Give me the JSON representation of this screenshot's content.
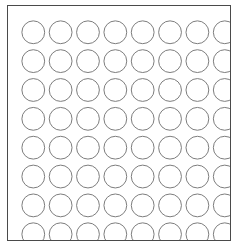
{
  "figure": {
    "name": "circle-grid-diagram",
    "type": "grid-of-circles",
    "background_color": "#ffffff"
  },
  "frame": {
    "name": "grid-frame",
    "border_color": "#4a4a4a",
    "border_width_px": 1,
    "fill_color": "#ffffff",
    "x": 7,
    "y": 5,
    "width": 224,
    "height": 236
  },
  "grid": {
    "rows": 8,
    "columns": 8,
    "total_circles": 64,
    "circle_radius_px": 11.5,
    "column_pitch_px": 27.6,
    "row_pitch_px": 29.1,
    "first_center_x": 21,
    "first_center_y": 20,
    "circle_stroke_color": "#7b7b7b",
    "circle_stroke_width_px": 1,
    "circle_fill": "none"
  },
  "circles": [
    {
      "row": 1,
      "col": 1,
      "cx": 21.0,
      "cy": 20.0
    },
    {
      "row": 1,
      "col": 2,
      "cx": 48.6,
      "cy": 20.0
    },
    {
      "row": 1,
      "col": 3,
      "cx": 76.2,
      "cy": 20.0
    },
    {
      "row": 1,
      "col": 4,
      "cx": 103.8,
      "cy": 20.0
    },
    {
      "row": 1,
      "col": 5,
      "cx": 131.4,
      "cy": 20.0
    },
    {
      "row": 1,
      "col": 6,
      "cx": 159.0,
      "cy": 20.0
    },
    {
      "row": 1,
      "col": 7,
      "cx": 186.6,
      "cy": 20.0
    },
    {
      "row": 1,
      "col": 8,
      "cx": 214.2,
      "cy": 20.0
    },
    {
      "row": 2,
      "col": 1,
      "cx": 21.0,
      "cy": 49.1
    },
    {
      "row": 2,
      "col": 2,
      "cx": 48.6,
      "cy": 49.1
    },
    {
      "row": 2,
      "col": 3,
      "cx": 76.2,
      "cy": 49.1
    },
    {
      "row": 2,
      "col": 4,
      "cx": 103.8,
      "cy": 49.1
    },
    {
      "row": 2,
      "col": 5,
      "cx": 131.4,
      "cy": 49.1
    },
    {
      "row": 2,
      "col": 6,
      "cx": 159.0,
      "cy": 49.1
    },
    {
      "row": 2,
      "col": 7,
      "cx": 186.6,
      "cy": 49.1
    },
    {
      "row": 2,
      "col": 8,
      "cx": 214.2,
      "cy": 49.1
    },
    {
      "row": 3,
      "col": 1,
      "cx": 21.0,
      "cy": 78.2
    },
    {
      "row": 3,
      "col": 2,
      "cx": 48.6,
      "cy": 78.2
    },
    {
      "row": 3,
      "col": 3,
      "cx": 76.2,
      "cy": 78.2
    },
    {
      "row": 3,
      "col": 4,
      "cx": 103.8,
      "cy": 78.2
    },
    {
      "row": 3,
      "col": 5,
      "cx": 131.4,
      "cy": 78.2
    },
    {
      "row": 3,
      "col": 6,
      "cx": 159.0,
      "cy": 78.2
    },
    {
      "row": 3,
      "col": 7,
      "cx": 186.6,
      "cy": 78.2
    },
    {
      "row": 3,
      "col": 8,
      "cx": 214.2,
      "cy": 78.2
    },
    {
      "row": 4,
      "col": 1,
      "cx": 21.0,
      "cy": 107.3
    },
    {
      "row": 4,
      "col": 2,
      "cx": 48.6,
      "cy": 107.3
    },
    {
      "row": 4,
      "col": 3,
      "cx": 76.2,
      "cy": 107.3
    },
    {
      "row": 4,
      "col": 4,
      "cx": 103.8,
      "cy": 107.3
    },
    {
      "row": 4,
      "col": 5,
      "cx": 131.4,
      "cy": 107.3
    },
    {
      "row": 4,
      "col": 6,
      "cx": 159.0,
      "cy": 107.3
    },
    {
      "row": 4,
      "col": 7,
      "cx": 186.6,
      "cy": 107.3
    },
    {
      "row": 4,
      "col": 8,
      "cx": 214.2,
      "cy": 107.3
    },
    {
      "row": 5,
      "col": 1,
      "cx": 21.0,
      "cy": 136.4
    },
    {
      "row": 5,
      "col": 2,
      "cx": 48.6,
      "cy": 136.4
    },
    {
      "row": 5,
      "col": 3,
      "cx": 76.2,
      "cy": 136.4
    },
    {
      "row": 5,
      "col": 4,
      "cx": 103.8,
      "cy": 136.4
    },
    {
      "row": 5,
      "col": 5,
      "cx": 131.4,
      "cy": 136.4
    },
    {
      "row": 5,
      "col": 6,
      "cx": 159.0,
      "cy": 136.4
    },
    {
      "row": 5,
      "col": 7,
      "cx": 186.6,
      "cy": 136.4
    },
    {
      "row": 5,
      "col": 8,
      "cx": 214.2,
      "cy": 136.4
    },
    {
      "row": 6,
      "col": 1,
      "cx": 21.0,
      "cy": 165.5
    },
    {
      "row": 6,
      "col": 2,
      "cx": 48.6,
      "cy": 165.5
    },
    {
      "row": 6,
      "col": 3,
      "cx": 76.2,
      "cy": 165.5
    },
    {
      "row": 6,
      "col": 4,
      "cx": 103.8,
      "cy": 165.5
    },
    {
      "row": 6,
      "col": 5,
      "cx": 131.4,
      "cy": 165.5
    },
    {
      "row": 6,
      "col": 6,
      "cx": 159.0,
      "cy": 165.5
    },
    {
      "row": 6,
      "col": 7,
      "cx": 186.6,
      "cy": 165.5
    },
    {
      "row": 6,
      "col": 8,
      "cx": 214.2,
      "cy": 165.5
    },
    {
      "row": 7,
      "col": 1,
      "cx": 21.0,
      "cy": 194.6
    },
    {
      "row": 7,
      "col": 2,
      "cx": 48.6,
      "cy": 194.6
    },
    {
      "row": 7,
      "col": 3,
      "cx": 76.2,
      "cy": 194.6
    },
    {
      "row": 7,
      "col": 4,
      "cx": 103.8,
      "cy": 194.6
    },
    {
      "row": 7,
      "col": 5,
      "cx": 131.4,
      "cy": 194.6
    },
    {
      "row": 7,
      "col": 6,
      "cx": 159.0,
      "cy": 194.6
    },
    {
      "row": 7,
      "col": 7,
      "cx": 186.6,
      "cy": 194.6
    },
    {
      "row": 7,
      "col": 8,
      "cx": 214.2,
      "cy": 194.6
    },
    {
      "row": 8,
      "col": 1,
      "cx": 21.0,
      "cy": 223.7
    },
    {
      "row": 8,
      "col": 2,
      "cx": 48.6,
      "cy": 223.7
    },
    {
      "row": 8,
      "col": 3,
      "cx": 76.2,
      "cy": 223.7
    },
    {
      "row": 8,
      "col": 4,
      "cx": 103.8,
      "cy": 223.7
    },
    {
      "row": 8,
      "col": 5,
      "cx": 131.4,
      "cy": 223.7
    },
    {
      "row": 8,
      "col": 6,
      "cx": 159.0,
      "cy": 223.7
    },
    {
      "row": 8,
      "col": 7,
      "cx": 186.6,
      "cy": 223.7
    },
    {
      "row": 8,
      "col": 8,
      "cx": 214.2,
      "cy": 223.7
    }
  ]
}
